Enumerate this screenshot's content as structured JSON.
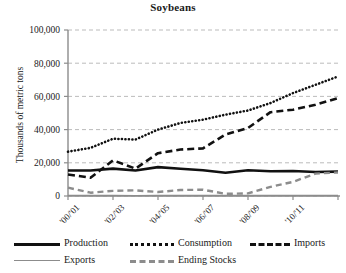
{
  "chart_data": {
    "type": "line",
    "title": "Soybeans",
    "xlabel": "",
    "ylabel": "Thousands of metric tons",
    "ylim": [
      0,
      100000
    ],
    "yticks": [
      0,
      20000,
      40000,
      60000,
      80000,
      100000
    ],
    "ytick_labels": [
      "0",
      "20,000",
      "40,000",
      "60,000",
      "80,000",
      "100,000"
    ],
    "grid": "horizontal-dashed",
    "legend_position": "bottom",
    "x": [
      "'00/'01",
      "'01/'02",
      "'02/'03",
      "'03/'04",
      "'04/'05",
      "'05/'06",
      "'06/'07",
      "'07/'08",
      "'08/'09",
      "'09/'10",
      "'10/'11",
      "'11/'12",
      "'12/'13"
    ],
    "xtick_labels": [
      "'00/'01",
      "'02/'03",
      "'04/'05",
      "'06/'07",
      "'08/'09",
      "'10/'11"
    ],
    "xtick_indices": [
      0,
      2,
      4,
      6,
      8,
      10
    ],
    "series": [
      {
        "name": "Production",
        "style": "solid-thick-black",
        "color": "#111111",
        "values": [
          15400,
          15400,
          16500,
          15400,
          17400,
          16400,
          15500,
          14000,
          15500,
          14900,
          15100,
          14500,
          14700
        ]
      },
      {
        "name": "Consumption",
        "style": "dotted-black",
        "color": "#111111",
        "values": [
          26700,
          29000,
          34500,
          34000,
          40000,
          44000,
          46000,
          49000,
          51500,
          56000,
          62000,
          67000,
          72000
        ]
      },
      {
        "name": "Imports",
        "style": "dashed-thick-black",
        "color": "#111111",
        "values": [
          13000,
          11000,
          21500,
          16500,
          25800,
          28000,
          28700,
          37000,
          41000,
          50500,
          52000,
          55000,
          59000
        ]
      },
      {
        "name": "Exports",
        "style": "solid-thin-gray",
        "color": "#8c8c8c",
        "values": [
          350,
          300,
          300,
          250,
          300,
          300,
          300,
          300,
          300,
          300,
          300,
          300,
          300
        ]
      },
      {
        "name": "Ending Stocks",
        "style": "dashed-gray",
        "color": "#8c8c8c",
        "values": [
          5000,
          2000,
          3100,
          3400,
          2400,
          3600,
          3800,
          1300,
          1600,
          5500,
          8500,
          13500,
          14200
        ]
      }
    ]
  },
  "legend": {
    "rows": [
      [
        {
          "label": "Production",
          "key": "production"
        },
        {
          "label": "Consumption",
          "key": "consumption"
        },
        {
          "label": "Imports",
          "key": "imports"
        }
      ],
      [
        {
          "label": "Exports",
          "key": "exports"
        },
        {
          "label": "Ending Stocks",
          "key": "stocks"
        }
      ]
    ]
  }
}
